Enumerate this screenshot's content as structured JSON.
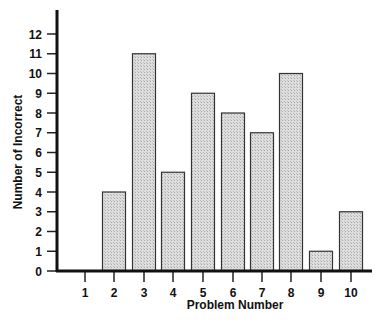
{
  "chart_data": {
    "type": "bar",
    "title": "",
    "xlabel": "Problem Number",
    "ylabel": "Number of Incorrect",
    "categories": [
      "1",
      "2",
      "3",
      "4",
      "5",
      "6",
      "7",
      "8",
      "9",
      "10"
    ],
    "values": [
      0,
      4,
      11,
      5,
      9,
      8,
      7,
      10,
      1,
      3
    ],
    "ylim": [
      0,
      12
    ],
    "yticks": [
      0,
      1,
      2,
      3,
      4,
      5,
      6,
      7,
      8,
      9,
      10,
      11,
      12
    ],
    "grid": false,
    "legend": null,
    "bar_fill": "#d4d4d4",
    "bar_stroke": "#333333",
    "axis_color": "#111111"
  }
}
